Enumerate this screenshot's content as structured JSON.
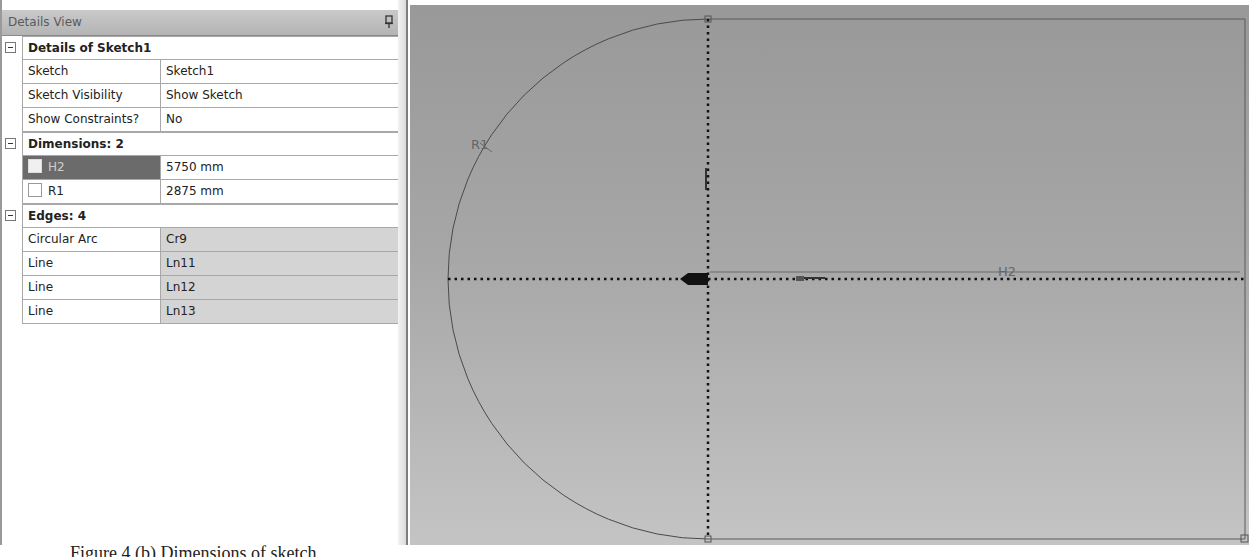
{
  "details_view": {
    "title": "Details View",
    "pin_icon": "pushpin-icon",
    "groups": [
      {
        "label": "Details of Sketch1",
        "expanded": true,
        "rows": [
          {
            "name": "Sketch",
            "value": "Sketch1",
            "readonly": false
          },
          {
            "name": "Sketch Visibility",
            "value": "Show Sketch",
            "readonly": false
          },
          {
            "name": "Show Constraints?",
            "value": "No",
            "readonly": false
          }
        ]
      },
      {
        "label": "Dimensions: 2",
        "expanded": true,
        "rows": [
          {
            "name": "H2",
            "value": "5750 mm",
            "checkbox": true,
            "selected": true
          },
          {
            "name": "R1",
            "value": "2875 mm",
            "checkbox": true,
            "selected": false
          }
        ]
      },
      {
        "label": "Edges: 4",
        "expanded": true,
        "rows": [
          {
            "name": "Circular Arc",
            "value": "Cr9",
            "readonly": true
          },
          {
            "name": "Line",
            "value": "Ln11",
            "readonly": true
          },
          {
            "name": "Line",
            "value": "Ln12",
            "readonly": true
          },
          {
            "name": "Line",
            "value": "Ln13",
            "readonly": true
          }
        ]
      }
    ]
  },
  "canvas": {
    "dimension_labels": {
      "radius": "R1",
      "horizontal": "H2"
    },
    "colors": {
      "background_top": "#999999",
      "background_bottom": "#c4c4c4",
      "geometry": "#4a4a4a",
      "axis": "#111111"
    }
  },
  "caption": "Figure 4 (b) Dimensions of sketch"
}
